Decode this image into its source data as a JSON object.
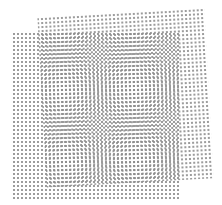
{
  "figure": {
    "title": "Moiré interference of two dot screens",
    "background_color": "#ffffff",
    "dot_color": "#8a8a8a",
    "layers": [
      {
        "name": "grid-a",
        "x": 13,
        "y": 33,
        "width": 167,
        "height": 167,
        "rotation_deg": 0,
        "dot_spacing": 4,
        "dot_size": 2
      },
      {
        "name": "grid-b",
        "x": 42,
        "y": 13,
        "width": 167,
        "height": 170,
        "rotation_deg": -3.2,
        "dot_spacing": 4,
        "dot_size": 2
      }
    ]
  }
}
